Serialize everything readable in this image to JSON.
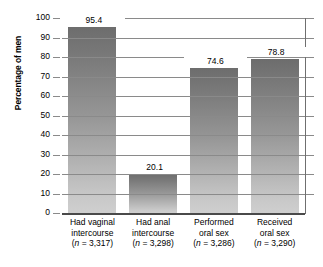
{
  "chart_data": {
    "type": "bar",
    "title": "",
    "subtitle": "",
    "xlabel": "",
    "ylabel": "Percentage of men",
    "ylim": [
      0,
      100
    ],
    "yticks": [
      0,
      10,
      20,
      30,
      40,
      50,
      60,
      70,
      80,
      90,
      100
    ],
    "ytick_labels": [
      "0",
      "10",
      "20",
      "30",
      "40",
      "50",
      "60",
      "70",
      "80",
      "90",
      "100"
    ],
    "grid": true,
    "legend": false,
    "legend_position": "none",
    "categories": [
      "Had vaginal intercourse",
      "Had anal intercourse",
      "Performed oral sex",
      "Received oral sex"
    ],
    "category_lines": [
      [
        "Had vaginal",
        "intercourse"
      ],
      [
        "Had anal",
        "intercourse"
      ],
      [
        "Performed",
        "oral sex"
      ],
      [
        "Received",
        "oral sex"
      ]
    ],
    "sample_sizes": [
      "3,317",
      "3,298",
      "3,286",
      "3,290"
    ],
    "sample_size_labels": [
      "(n = 3,317)",
      "(n = 3,298)",
      "(n = 3,286)",
      "(n = 3,290)"
    ],
    "values": [
      95.4,
      20.1,
      74.6,
      78.8
    ],
    "value_labels": [
      "95.4",
      "20.1",
      "74.6",
      "78.8"
    ],
    "bar_color_top": "#6d6d6d",
    "bar_color_bottom": "#cfcfcf",
    "gridline_color": "#8a8a8a",
    "axis_color": "#4a4a4a"
  }
}
